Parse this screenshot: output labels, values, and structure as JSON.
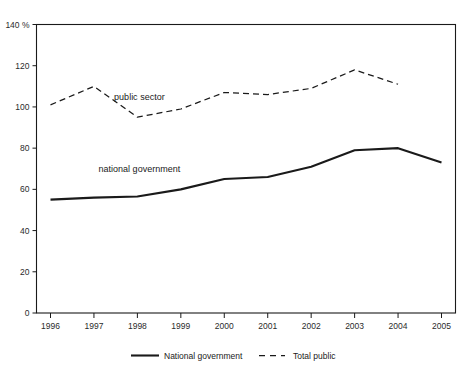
{
  "chart_data": {
    "type": "line",
    "title": "",
    "subtitle": "",
    "xlabel": "",
    "ylabel": "",
    "y_unit": "%",
    "categories": [
      "1996",
      "1997",
      "1998",
      "1999",
      "2000",
      "2001",
      "2002",
      "2003",
      "2004",
      "2005"
    ],
    "ylim": [
      0,
      140
    ],
    "yticks": [
      "0",
      "20",
      "40",
      "60",
      "80",
      "100",
      "120",
      "140"
    ],
    "ytick_values": [
      0,
      20,
      40,
      60,
      80,
      100,
      120,
      140
    ],
    "top_tick_label": "140 %",
    "grid": false,
    "legend_position": "bottom-center",
    "series": [
      {
        "name": "National government",
        "style": "solid",
        "color": "#1a1a1a",
        "x": [
          "1996",
          "1997",
          "1998",
          "1999",
          "2000",
          "2001",
          "2002",
          "2003",
          "2004",
          "2005"
        ],
        "values": [
          55,
          56,
          56.5,
          60,
          65,
          66,
          71,
          79,
          80,
          73
        ]
      },
      {
        "name": "Total public",
        "style": "dashed",
        "color": "#1a1a1a",
        "x": [
          "1996",
          "1997",
          "1998",
          "1999",
          "2000",
          "2001",
          "2002",
          "2003",
          "2004"
        ],
        "values": [
          101,
          110,
          95,
          99,
          107,
          106,
          109,
          118,
          111
        ]
      }
    ],
    "annotations": [
      {
        "text": "public sector",
        "x_value": "1998",
        "y_value": 105
      },
      {
        "text": "national government",
        "x_value": "1998",
        "y_value": 70
      }
    ]
  },
  "legend": {
    "items": [
      {
        "label": "National government",
        "style": "solid"
      },
      {
        "label": "Total public",
        "style": "dashed"
      }
    ]
  }
}
